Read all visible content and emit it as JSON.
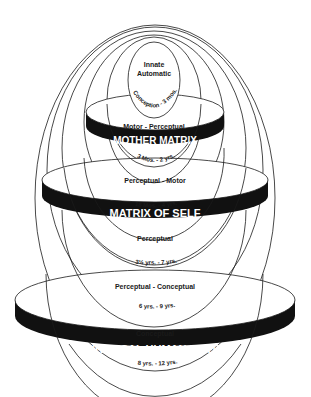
{
  "diagram": {
    "type": "nested-ellipses-with-discs",
    "colors": {
      "line": "#1a1a1a",
      "band": "#111111",
      "band_text": "#ffffff",
      "background": "#ffffff"
    },
    "stages": [
      {
        "stage": "Innate\nAutomatic",
        "line1": "Innate",
        "line2": "Automatic",
        "age": "Conception - 3 mos."
      },
      {
        "stage": "Motor - Perceptual",
        "age": "3 Mos. - 2 yrs."
      },
      {
        "stage": "Perceptual - Motor",
        "age": "18 Mos. - 4 yrs."
      },
      {
        "stage": "Perceptual",
        "age": "3½ yrs. - 7 yrs."
      },
      {
        "stage": "Perceptual - Conceptual",
        "age": "6 yrs. - 9 yrs."
      },
      {
        "stage": "Conceptual",
        "age": "8 yrs. - 12 yrs."
      }
    ],
    "matrices": [
      {
        "label": "MOTHER MATRIX"
      },
      {
        "label": "MATRIX OF SELF"
      },
      {
        "label": "UNIVERSAL HUMAN MATRIX"
      }
    ]
  }
}
